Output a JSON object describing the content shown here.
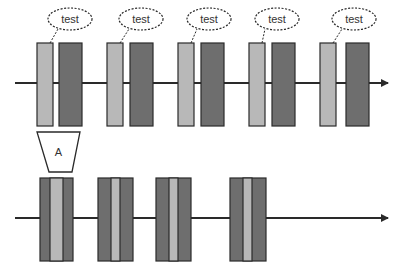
{
  "colors": {
    "background": "#ffffff",
    "light_bar": "#b8b8b8",
    "dark_bar": "#6e6e6e",
    "stroke": "#2a2a2a",
    "text": "#333333"
  },
  "top_row": {
    "axis": {
      "x1": 15,
      "x2": 382,
      "y": 83
    },
    "arrow_tip_x": 389,
    "units": [
      {
        "callout": "test",
        "light": {
          "x": 37,
          "w": 16
        },
        "dark": {
          "x": 59,
          "w": 23
        },
        "ellipse": {
          "cx": 70,
          "cy": 19
        }
      },
      {
        "callout": "test",
        "light": {
          "x": 107,
          "w": 16
        },
        "dark": {
          "x": 130,
          "w": 23
        },
        "ellipse": {
          "cx": 141,
          "cy": 19
        }
      },
      {
        "callout": "test",
        "light": {
          "x": 178,
          "w": 16
        },
        "dark": {
          "x": 201,
          "w": 23
        },
        "ellipse": {
          "cx": 209,
          "cy": 19
        }
      },
      {
        "callout": "test",
        "light": {
          "x": 249,
          "w": 16
        },
        "dark": {
          "x": 272,
          "w": 23
        },
        "ellipse": {
          "cx": 277,
          "cy": 19
        }
      },
      {
        "callout": "test",
        "light": {
          "x": 320,
          "w": 16
        },
        "dark": {
          "x": 346,
          "w": 23
        },
        "ellipse": {
          "cx": 354,
          "cy": 19
        }
      }
    ],
    "bar_top": 43,
    "bar_bottom": 126
  },
  "transform_box": {
    "label": "A",
    "top_left_x": 37,
    "top_right_x": 80,
    "top_y": 132,
    "bottom_left_x": 49,
    "bottom_right_x": 72,
    "bottom_y": 172
  },
  "bottom_row": {
    "axis": {
      "x1": 15,
      "x2": 382,
      "y": 218
    },
    "arrow_tip_x": 389,
    "bar_top": 178,
    "bar_bottom": 261,
    "groups": [
      {
        "x": 40,
        "w": 33,
        "light_x": 50,
        "light_w": 13
      },
      {
        "x": 98,
        "w": 35,
        "light_x": 111,
        "light_w": 9
      },
      {
        "x": 156,
        "w": 35,
        "light_x": 169,
        "light_w": 9
      },
      {
        "x": 230,
        "w": 36,
        "light_x": 243,
        "light_w": 9
      }
    ]
  }
}
